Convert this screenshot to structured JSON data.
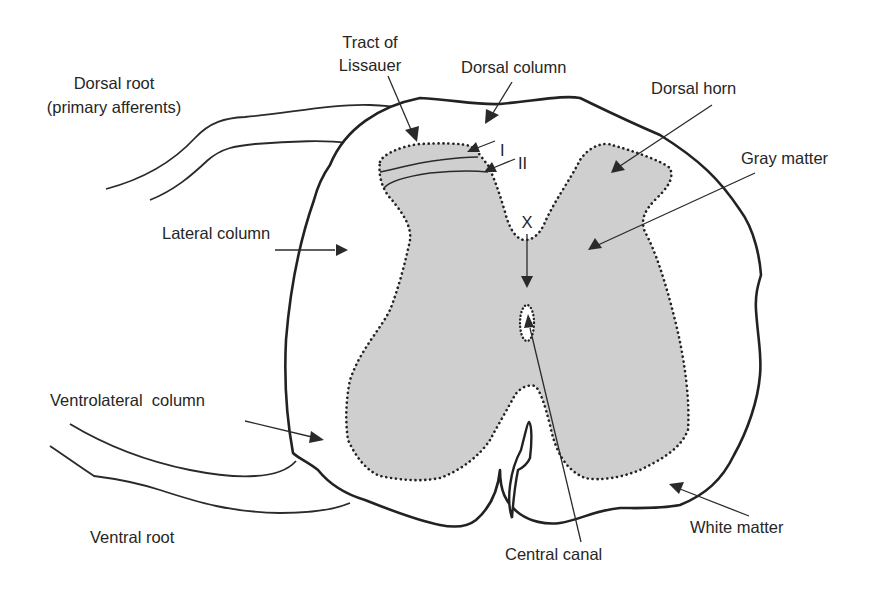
{
  "figure": {
    "labels": {
      "tract_of_lissauer": [
        "Tract of",
        "Lissauer"
      ],
      "dorsal_root": [
        "Dorsal root",
        "(primary afferents)"
      ],
      "dorsal_column": "Dorsal column",
      "dorsal_horn": "Dorsal horn",
      "lamina_i": "I",
      "lamina_ii": "II",
      "gray_matter": "Gray matter",
      "lateral_column": "Lateral column",
      "lamina_x": "X",
      "ventrolateral_column": "Ventrolateral  column",
      "ventral_root": "Ventral root",
      "central_canal": "Central canal",
      "white_matter": "White matter"
    },
    "colors": {
      "gray_matter_fill": "#cfcfcf",
      "line": "#222222",
      "text": "#262626",
      "background": "#ffffff"
    }
  }
}
